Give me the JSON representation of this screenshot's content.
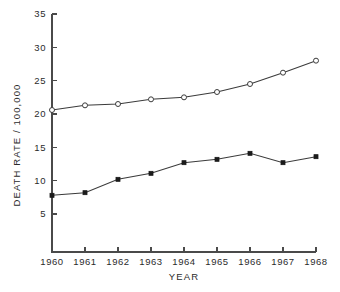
{
  "chart_data": {
    "type": "line",
    "title": "",
    "xlabel": "YEAR",
    "ylabel": "DEATH RATE / 100,000",
    "x": [
      1960,
      1961,
      1962,
      1963,
      1964,
      1965,
      1966,
      1967,
      1968
    ],
    "xticklabels": [
      "1960",
      "1961",
      "1962",
      "1963",
      "1964",
      "1965",
      "1966",
      "1967",
      "1968"
    ],
    "yticks": [
      5,
      10,
      15,
      20,
      25,
      30,
      35
    ],
    "yticklabels": [
      "5",
      "10",
      "15",
      "20",
      "25",
      "30",
      "35"
    ],
    "xlim": [
      1960,
      1968
    ],
    "ylim": [
      0,
      35
    ],
    "grid": false,
    "legend": "none",
    "series": [
      {
        "name": "upper-series",
        "marker": "open-circle",
        "values": [
          20.6,
          21.3,
          21.5,
          22.2,
          22.5,
          23.3,
          24.5,
          26.2,
          28.0
        ]
      },
      {
        "name": "lower-series",
        "marker": "filled-square",
        "values": [
          7.8,
          8.2,
          10.2,
          11.1,
          12.7,
          13.2,
          14.1,
          12.7,
          13.6
        ]
      }
    ]
  }
}
